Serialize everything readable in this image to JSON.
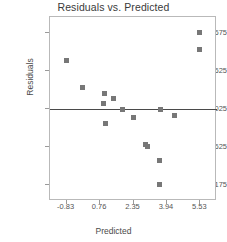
{
  "chart_data": {
    "type": "scatter",
    "title": "Residuals vs. Predicted",
    "xlabel": "Predicted",
    "ylabel": "Residuals",
    "xlim": [
      -1.62,
      6.32
    ],
    "ylim": [
      -2.45,
      2.49
    ],
    "xticks": [
      "-0.83",
      "0.76",
      "2.35",
      "3.94",
      "5.53"
    ],
    "xtick_values": [
      -0.83,
      0.76,
      2.35,
      3.94,
      5.53
    ],
    "yticks": [
      "2.0675",
      "1.04625",
      "0.025",
      "-0.99625",
      "-2.0175"
    ],
    "ytick_values": [
      2.0675,
      1.04625,
      0.025,
      -0.99625,
      -2.0175
    ],
    "grid": false,
    "legend": false,
    "reference_line": {
      "orientation": "horizontal",
      "y": 0.025,
      "color": "#4a4a4a"
    },
    "marker": {
      "shape": "square",
      "color": "#777777",
      "size": 5
    },
    "points": [
      {
        "x": -0.83,
        "y": 1.32
      },
      {
        "x": -0.06,
        "y": 0.61
      },
      {
        "x": 0.96,
        "y": 0.44
      },
      {
        "x": 0.9,
        "y": 0.17
      },
      {
        "x": 1.4,
        "y": 0.29
      },
      {
        "x": 1.82,
        "y": 0.01
      },
      {
        "x": 1.03,
        "y": -0.37
      },
      {
        "x": 2.35,
        "y": -0.21
      },
      {
        "x": 2.93,
        "y": -0.93
      },
      {
        "x": 3.0,
        "y": -0.99
      },
      {
        "x": 3.62,
        "y": 0.01
      },
      {
        "x": 3.58,
        "y": -1.37
      },
      {
        "x": 3.6,
        "y": -2.01
      },
      {
        "x": 4.29,
        "y": -0.16
      },
      {
        "x": 5.5,
        "y": 2.07
      },
      {
        "x": 5.5,
        "y": 1.62
      }
    ]
  },
  "axes": {
    "plot_left": 49,
    "plot_top": 16,
    "plot_width": 167,
    "plot_height": 184
  }
}
